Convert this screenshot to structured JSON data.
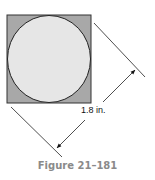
{
  "figure": {
    "caption": "Figure 21–181",
    "dimension_label": "1.8 in.",
    "shapes": {
      "square": {
        "fill": "#a8a8a8",
        "stroke": "#333333"
      },
      "circle": {
        "fill": "#e6e6e6",
        "stroke": "#222222"
      }
    }
  }
}
